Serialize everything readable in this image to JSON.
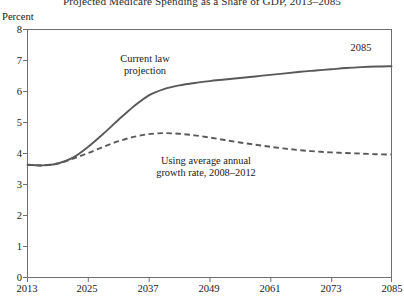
{
  "chart_data": {
    "type": "line",
    "title": "Projected Medicare Spending as a Share of GDP, 2013–2085",
    "xlabel": "",
    "ylabel": "Percent",
    "ylim": [
      0,
      8
    ],
    "xlim": [
      2013,
      2085
    ],
    "yticks": [
      "8",
      "7",
      "6",
      "5",
      "4",
      "3",
      "2",
      "1",
      "0"
    ],
    "ytick_values": [
      8,
      7,
      6,
      5,
      4,
      3,
      2,
      1,
      0
    ],
    "xticks": [
      "2013",
      "2025",
      "2037",
      "2049",
      "2061",
      "2073",
      "2085"
    ],
    "xtick_values": [
      2013,
      2025,
      2037,
      2049,
      2061,
      2073,
      2085
    ],
    "grid": false,
    "legend_position": "inline-annotations",
    "series": [
      {
        "name": "Current law projection",
        "style": "solid",
        "color": "#59595b",
        "x": [
          2013,
          2016,
          2019,
          2022,
          2025,
          2028,
          2031,
          2034,
          2037,
          2040,
          2043,
          2046,
          2049,
          2052,
          2055,
          2058,
          2061,
          2064,
          2067,
          2070,
          2073,
          2076,
          2079,
          2082,
          2085
        ],
        "values": [
          3.62,
          3.6,
          3.66,
          3.85,
          4.2,
          4.62,
          5.07,
          5.5,
          5.86,
          6.06,
          6.18,
          6.26,
          6.32,
          6.37,
          6.42,
          6.47,
          6.52,
          6.57,
          6.62,
          6.66,
          6.7,
          6.74,
          6.77,
          6.79,
          6.8
        ]
      },
      {
        "name": "Using average annual growth rate, 2008–2012",
        "style": "dashed",
        "color": "#59595b",
        "x": [
          2013,
          2016,
          2019,
          2022,
          2025,
          2028,
          2031,
          2034,
          2037,
          2040,
          2043,
          2046,
          2049,
          2052,
          2055,
          2058,
          2061,
          2064,
          2067,
          2070,
          2073,
          2076,
          2079,
          2082,
          2085
        ],
        "values": [
          3.62,
          3.6,
          3.66,
          3.82,
          4.0,
          4.2,
          4.38,
          4.52,
          4.61,
          4.64,
          4.62,
          4.57,
          4.5,
          4.42,
          4.34,
          4.27,
          4.2,
          4.14,
          4.09,
          4.05,
          4.02,
          4.0,
          3.98,
          3.96,
          3.95
        ]
      }
    ],
    "annotations": [
      {
        "id": "current-law",
        "text_line1": "Current law",
        "text_line2": "projection"
      },
      {
        "id": "avg-growth",
        "text_line1": "Using average annual",
        "text_line2": "growth rate, 2008–2012"
      },
      {
        "id": "endyear",
        "text": "2085"
      }
    ],
    "colors": {
      "line": "#59595b",
      "axis": "#6e6e70",
      "text": "#1a1a1a",
      "background": "#ffffff"
    }
  }
}
